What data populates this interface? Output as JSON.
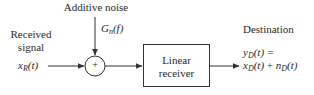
{
  "diagram": {
    "type": "block-diagram",
    "nodes": {
      "noise_label": "Additive noise",
      "noise_psd": {
        "base": "G",
        "sub": "n",
        "arg": "(f)"
      },
      "input_label_line1": "Received",
      "input_label_line2": "signal",
      "input_signal": {
        "base": "x",
        "sub": "R",
        "arg": "(t)"
      },
      "summer_symbol": "+",
      "receiver_line1": "Linear",
      "receiver_line2": "receiver",
      "output_label": "Destination",
      "output_eq_line1": {
        "base": "y",
        "sub": "D",
        "arg": "(t) ="
      },
      "output_eq_line2": {
        "term1": {
          "base": "x",
          "sub": "D",
          "arg": "(t)"
        },
        "op": "+",
        "term2": {
          "base": "n",
          "sub": "D",
          "arg": "(t)"
        }
      }
    },
    "edges": [
      {
        "from": "input_signal",
        "to": "summer"
      },
      {
        "from": "noise",
        "to": "summer"
      },
      {
        "from": "summer",
        "to": "linear_receiver"
      },
      {
        "from": "linear_receiver",
        "to": "destination"
      }
    ],
    "colors": {
      "stroke": "#333333",
      "text": "#2a2a2a",
      "background": "#ffffff"
    }
  }
}
